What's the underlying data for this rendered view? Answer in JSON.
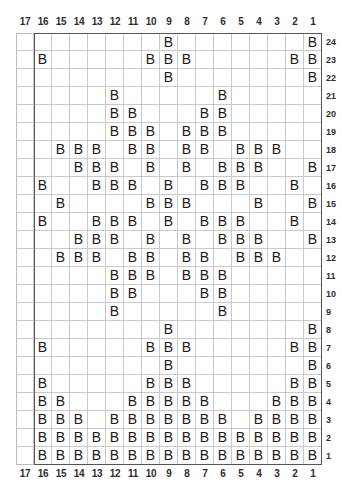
{
  "chart_data": {
    "type": "table",
    "symbol": "B",
    "columns": 17,
    "rows": 24,
    "xlabel": "",
    "ylabel": "",
    "grid": true,
    "legend": [],
    "column_labels": [
      "17",
      "16",
      "15",
      "14",
      "13",
      "12",
      "11",
      "10",
      "9",
      "8",
      "7",
      "6",
      "5",
      "4",
      "3",
      "2",
      "1"
    ],
    "row_labels": [
      "24",
      "23",
      "22",
      "21",
      "20",
      "19",
      "18",
      "17",
      "16",
      "15",
      "14",
      "13",
      "12",
      "11",
      "10",
      "9",
      "8",
      "7",
      "6",
      "5",
      "4",
      "3",
      "2",
      "1"
    ],
    "axis_note": "Columns numbered right-to-left 1..17; rows numbered bottom-to-top 1..24",
    "filled_cells": {
      "24": [
        9,
        1
      ],
      "23": [
        16,
        10,
        9,
        8,
        2,
        1
      ],
      "22": [
        9,
        1
      ],
      "21": [
        12,
        6
      ],
      "20": [
        12,
        11,
        7,
        6
      ],
      "19": [
        12,
        11,
        10,
        8,
        7,
        6
      ],
      "18": [
        15,
        14,
        13,
        11,
        10,
        8,
        7,
        5,
        4,
        3
      ],
      "17": [
        14,
        13,
        12,
        10,
        8,
        6,
        5,
        4,
        1
      ],
      "16": [
        16,
        13,
        12,
        11,
        9,
        7,
        6,
        5,
        2
      ],
      "15": [
        15,
        10,
        9,
        8,
        4,
        1
      ],
      "14": [
        16,
        13,
        12,
        11,
        9,
        7,
        6,
        5,
        2
      ],
      "13": [
        14,
        13,
        12,
        10,
        8,
        6,
        5,
        4,
        1
      ],
      "12": [
        15,
        14,
        13,
        11,
        10,
        8,
        7,
        5,
        4,
        3
      ],
      "11": [
        12,
        11,
        10,
        8,
        7,
        6
      ],
      "10": [
        12,
        11,
        7,
        6
      ],
      "9": [
        12,
        6
      ],
      "8": [
        9,
        1
      ],
      "7": [
        16,
        10,
        9,
        8,
        2,
        1
      ],
      "6": [
        9,
        1
      ],
      "5": [
        16,
        10,
        9,
        8,
        2,
        1
      ],
      "4": [
        16,
        15,
        11,
        10,
        9,
        8,
        7,
        3,
        2,
        1
      ],
      "3": [
        16,
        15,
        14,
        12,
        11,
        10,
        9,
        8,
        7,
        6,
        4,
        3,
        2,
        1
      ],
      "2": [
        16,
        15,
        14,
        13,
        12,
        11,
        10,
        9,
        8,
        7,
        6,
        5,
        4,
        3,
        2,
        1
      ],
      "1": [
        16,
        15,
        14,
        13,
        12,
        11,
        10,
        9,
        8,
        7,
        6,
        5,
        4,
        3,
        2,
        1
      ]
    },
    "colors": {
      "grid_line": "#c9c9c9",
      "block_border": "#555555",
      "symbol": "#1a1a1a",
      "background": "#ffffff",
      "label": "#2d2d2d"
    }
  }
}
